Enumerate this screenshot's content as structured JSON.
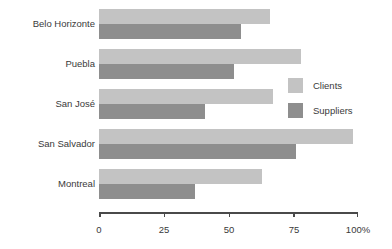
{
  "chart_data": {
    "type": "bar",
    "orientation": "horizontal",
    "title": "",
    "xlabel": "",
    "ylabel": "",
    "xlim": [
      0,
      100
    ],
    "xticks": [
      0,
      25,
      50,
      75,
      100
    ],
    "xtick_labels": [
      "0",
      "25",
      "50",
      "75",
      "100%"
    ],
    "grid": false,
    "legend_position": "center-right",
    "categories": [
      "Belo Horizonte",
      "Puebla",
      "San José",
      "San Salvador",
      "Montreal"
    ],
    "series": [
      {
        "name": "Clients",
        "color": "#c3c3c3",
        "values": [
          66,
          78,
          67,
          98,
          63
        ]
      },
      {
        "name": "Suppliers",
        "color": "#8e8e8e",
        "values": [
          55,
          52,
          41,
          76,
          37
        ]
      }
    ]
  },
  "legend": {
    "items": [
      {
        "label": "Clients"
      },
      {
        "label": "Suppliers"
      }
    ]
  },
  "axis": {
    "tick_labels": [
      "0",
      "25",
      "50",
      "75",
      "100%"
    ]
  },
  "colors": {
    "clients": "#c3c3c3",
    "suppliers": "#8e8e8e",
    "axis": "#4a4a4a",
    "text": "#3a3a3a",
    "background": "#ffffff"
  }
}
